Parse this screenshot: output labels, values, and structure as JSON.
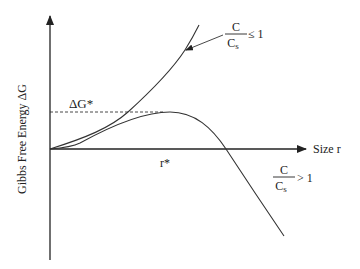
{
  "diagram": {
    "type": "nucleation-free-energy-curve",
    "y_axis_label": "Gibbs Free Energy  ΔG",
    "x_axis_label": "Size r",
    "barrier_label": "ΔG*",
    "critical_radius_label": "r*",
    "curves": [
      {
        "name": "undersaturated",
        "numerator": "C",
        "denominator": "C",
        "denominator_subscript": "s",
        "relation": "≤ 1",
        "behavior": "monotonically increasing"
      },
      {
        "name": "supersaturated",
        "numerator": "C",
        "denominator": "C",
        "denominator_subscript": "s",
        "relation": "> 1",
        "behavior": "rises to maximum ΔG* at r*, then decreases"
      }
    ],
    "colors": {
      "line": "#333333",
      "text": "#222222",
      "background": "#ffffff"
    }
  }
}
